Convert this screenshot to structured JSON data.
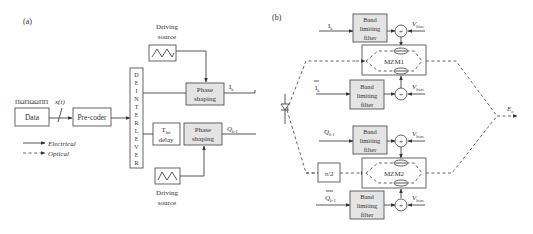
{
  "panel_a": {
    "label": "(a)",
    "data_box": "Data",
    "bit_pattern": "ΠΩΠΩΩΠΠ",
    "signal_label": "x(t)",
    "precoder": "Pre-coder",
    "deinterleaver_letters": [
      "D",
      "E",
      "I",
      "N",
      "T",
      "E",
      "R",
      "L",
      "E",
      "V",
      "E",
      "R"
    ],
    "driving_source_top": {
      "line1": "Driving",
      "line2": "source"
    },
    "driving_source_bottom": {
      "line1": "Driving",
      "line2": "source"
    },
    "phase_shaping_top": {
      "line1": "Phase",
      "line2": "shaping"
    },
    "phase_shaping_bottom": {
      "line1": "Phase",
      "line2": "shaping"
    },
    "delay_box": {
      "line1": "T",
      "sub": "bit",
      "line2": "delay"
    },
    "output_i": {
      "main": "I",
      "sub": "k"
    },
    "output_q": {
      "main": "Q",
      "sub": "k-1"
    },
    "legend": [
      {
        "label": "Electrical",
        "style": "solid"
      },
      {
        "label": "Optical",
        "style": "dashed"
      }
    ]
  },
  "panel_b": {
    "label": "(b)",
    "filter": {
      "line1": "Band",
      "line2": "limiting",
      "line3": "filter"
    },
    "inputs": [
      {
        "main": "I",
        "sub": "k",
        "overbar": false
      },
      {
        "main": "I",
        "sub": "k",
        "overbar": true
      },
      {
        "main": "Q",
        "sub": "k-1",
        "overbar": false
      },
      {
        "main": "Q",
        "sub": "k-1",
        "overbar": true
      }
    ],
    "bias": {
      "main": "V",
      "sub": "bias"
    },
    "adder_symbol": "+",
    "mzm1": "MZM1",
    "mzm2": "MZM2",
    "phase_shift": "π/2",
    "output": {
      "main": "E",
      "sub": "o"
    }
  }
}
